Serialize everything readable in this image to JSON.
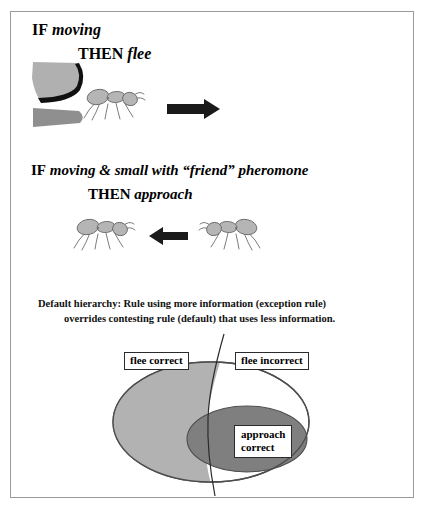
{
  "figure": {
    "background_color": "#ffffff",
    "frame_color": "#9a9a9a"
  },
  "rule1": {
    "if_keyword": "IF",
    "condition": "moving",
    "then_keyword": "THEN",
    "action": "flee",
    "arrow_direction": "right",
    "arrow_color": "#1a1a1a"
  },
  "rule2": {
    "if_keyword": "IF",
    "condition": "moving & small with “friend” pheromone",
    "then_keyword": "THEN",
    "action": "approach",
    "arrow_direction": "left",
    "arrow_color": "#1a1a1a"
  },
  "caption": {
    "line1": "Default hierarchy:  Rule using more information (exception rule)",
    "line2": "overrides contesting rule (default) that uses less information."
  },
  "venn": {
    "outer_label": "flee incorrect",
    "left_region_label": "flee correct",
    "inner_label_line1": "approach",
    "inner_label_line2": "correct",
    "colors": {
      "outer_fill": "#ffffff",
      "outer_stroke": "#4d4d4d",
      "left_fill": "#b2b2b2",
      "inner_fill": "#7f7f7f",
      "inner_stroke": "#4d4d4d",
      "divider_stroke": "#2b2b2b"
    }
  },
  "art": {
    "predator_color": "#b0b0b0",
    "predator_band_color": "#101010",
    "predator_jaw_color": "#8f8f8f",
    "ant_body_color": "#b5b5b5",
    "ant_outline_color": "#6b6b6b"
  }
}
